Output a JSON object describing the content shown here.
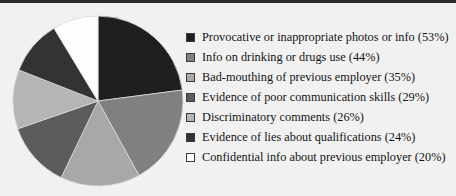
{
  "chart_data": {
    "type": "pie",
    "title": "",
    "subtitle": "",
    "xlabel": "",
    "ylabel": "",
    "legend_position": "right",
    "grid": false,
    "value_suffix": "%",
    "note": "Multi-response survey; percentages sum to 231% and slice angles are proportional to each value's share of that total.",
    "categories": [
      "Provocative or inappropriate photos or info",
      "Info on drinking or drugs use",
      "Bad-mouthing of previous employer",
      "Evidence of poor communication skills",
      "Discriminatory comments",
      "Evidence of lies about qualifications",
      "Confidential info about previous employer"
    ],
    "values": [
      53,
      44,
      35,
      29,
      26,
      24,
      20
    ],
    "slices": [
      {
        "label": "Provocative or inappropriate photos or info (53%)",
        "name": "Provocative or inappropriate photos or info",
        "value": 53,
        "color": "#1f1f1f"
      },
      {
        "label": "Info on drinking or drugs use (44%)",
        "name": "Info on drinking or drugs use",
        "value": 44,
        "color": "#808080"
      },
      {
        "label": "Bad-mouthing of previous employer (35%)",
        "name": "Bad-mouthing of previous employer",
        "value": 35,
        "color": "#a8a8a8"
      },
      {
        "label": "Evidence of poor communication skills (29%)",
        "name": "Evidence of poor communication skills",
        "value": 29,
        "color": "#5c5c5c"
      },
      {
        "label": "Discriminatory comments (26%)",
        "name": "Discriminatory comments",
        "value": 26,
        "color": "#b5b5b5"
      },
      {
        "label": "Evidence of lies about qualifications (24%)",
        "name": "Evidence of lies about qualifications",
        "value": 24,
        "color": "#333333"
      },
      {
        "label": "Confidential info about previous employer (20%)",
        "name": "Confidential info about previous employer",
        "value": 20,
        "color": "#fdfdfd"
      }
    ]
  },
  "colors": {
    "background": "#f1f1f1",
    "top_rule": "#2b2b2b",
    "text": "#141414",
    "swatch_border": "#3a3a3a"
  }
}
